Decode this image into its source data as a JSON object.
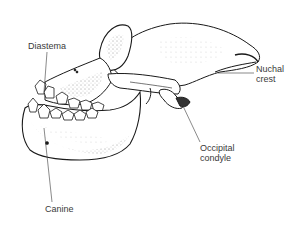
{
  "figure": {
    "labels": [
      {
        "id": "diastema",
        "lines": [
          "Diastema"
        ]
      },
      {
        "id": "nuchal_crest",
        "lines": [
          "Nuchal",
          "crest"
        ]
      },
      {
        "id": "occipital_condyle",
        "lines": [
          "Occipital",
          "condyle"
        ]
      },
      {
        "id": "canine",
        "lines": [
          "Canine"
        ]
      }
    ]
  },
  "colors": {
    "ink": "#1a1a1a",
    "label": "#3a3a3a",
    "background": "#ffffff"
  }
}
